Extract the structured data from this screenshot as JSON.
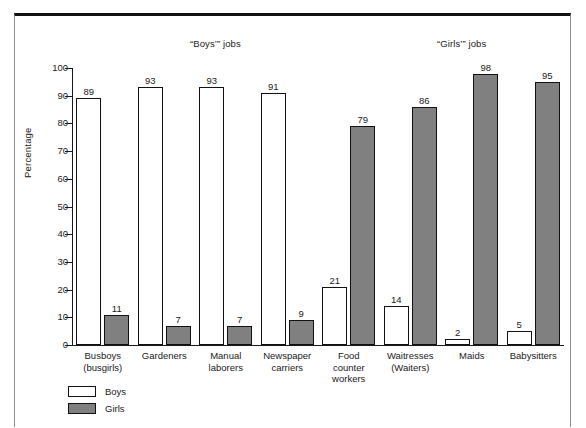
{
  "chart_data": {
    "type": "bar",
    "title": "",
    "xlabel": "",
    "ylabel": "Percentage",
    "ylim": [
      0,
      100
    ],
    "ytick_step": 10,
    "yticks": [
      100,
      90,
      80,
      70,
      60,
      50,
      40,
      30,
      20,
      10,
      0
    ],
    "grid": false,
    "legend_position": "bottom-left",
    "section_titles": {
      "boys": "“Boys’” jobs",
      "girls": "“Girls’” jobs"
    },
    "categories": [
      "Busboys\n(busgirls)",
      "Gardeners",
      "Manual\nlaborers",
      "Newspaper\ncarriers",
      "Food\ncounter\nworkers",
      "Waitresses\n(Waiters)",
      "Maids",
      "Babysitters"
    ],
    "series": [
      {
        "name": "Boys",
        "color": "#ffffff",
        "values": [
          89,
          93,
          93,
          91,
          21,
          14,
          2,
          5
        ]
      },
      {
        "name": "Girls",
        "color": "#808080",
        "values": [
          11,
          7,
          7,
          9,
          79,
          86,
          98,
          95
        ]
      }
    ]
  },
  "legend": {
    "items": [
      {
        "label": "Boys",
        "swatch": "boys"
      },
      {
        "label": "Girls",
        "swatch": "girls"
      }
    ]
  }
}
